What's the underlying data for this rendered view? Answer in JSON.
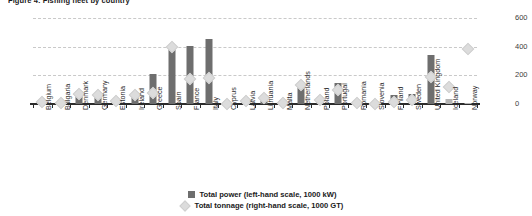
{
  "title": "Figure 4: Fishing fleet by country",
  "legend": {
    "power_label": "Total power (left-hand scale, 1000 kW)",
    "tonnage_label": "Total tonnage (right-hand scale, 1000 GT)",
    "power_color": "#6e6e6e",
    "tonnage_color": "#dcdcdc"
  },
  "axes": {
    "left_ticks": [
      "0",
      "500",
      "1000",
      "1500"
    ],
    "right_ticks": [
      "0",
      "200",
      "400",
      "600"
    ]
  },
  "chart_data": {
    "type": "bar",
    "title": "Figure 4: Fishing fleet by country",
    "xlabel": "",
    "ylabel": "Total power (1000 kW)",
    "y2label": "Total tonnage (1000 GT)",
    "ylim": [
      0,
      1500
    ],
    "y2lim": [
      0,
      600
    ],
    "grid": true,
    "legend_position": "bottom",
    "categories": [
      "Belgium",
      "Bulgaria",
      "Denmark",
      "Germany",
      "Estonia",
      "Ireland",
      "Greece",
      "Spain",
      "France",
      "Italy",
      "Cyprus",
      "Latvia",
      "Lithuania",
      "Malta",
      "Netherlands",
      "Poland",
      "Portugal",
      "Romania",
      "Slovenia",
      "Finland",
      "Sweden",
      "United Kingdom",
      "Iceland",
      "Norway"
    ],
    "series": [
      {
        "name": "Total power (left-hand scale, 1000 kW)",
        "axis": "left",
        "type": "bar",
        "values": [
          48,
          52,
          230,
          160,
          50,
          195,
          520,
          960,
          1010,
          1140,
          40,
          50,
          60,
          78,
          320,
          80,
          370,
          35,
          10,
          165,
          175,
          850,
          90,
          25
        ]
      },
      {
        "name": "Total tonnage (right-hand scale, 1000 GT)",
        "axis": "right",
        "type": "scatter",
        "values": [
          14,
          7,
          70,
          65,
          18,
          62,
          80,
          400,
          175,
          180,
          3,
          22,
          45,
          7,
          130,
          30,
          95,
          6,
          1,
          17,
          30,
          185,
          120,
          385
        ]
      }
    ]
  },
  "bars": [
    {
      "country": "Belgium",
      "power": 48,
      "tonnage": 14,
      "eu": true
    },
    {
      "country": "Bulgaria",
      "power": 52,
      "tonnage": 7,
      "eu": true
    },
    {
      "country": "Denmark",
      "power": 230,
      "tonnage": 70,
      "eu": true
    },
    {
      "country": "Germany",
      "power": 160,
      "tonnage": 65,
      "eu": true
    },
    {
      "country": "Estonia",
      "power": 50,
      "tonnage": 18,
      "eu": true
    },
    {
      "country": "Ireland",
      "power": 195,
      "tonnage": 62,
      "eu": true
    },
    {
      "country": "Greece",
      "power": 520,
      "tonnage": 80,
      "eu": true
    },
    {
      "country": "Spain",
      "power": 960,
      "tonnage": 400,
      "eu": true
    },
    {
      "country": "France",
      "power": 1010,
      "tonnage": 175,
      "eu": true
    },
    {
      "country": "Italy",
      "power": 1140,
      "tonnage": 180,
      "eu": true
    },
    {
      "country": "Cyprus",
      "power": 40,
      "tonnage": 3,
      "eu": true
    },
    {
      "country": "Latvia",
      "power": 50,
      "tonnage": 22,
      "eu": true
    },
    {
      "country": "Lithuania",
      "power": 60,
      "tonnage": 45,
      "eu": true
    },
    {
      "country": "Malta",
      "power": 78,
      "tonnage": 7,
      "eu": true
    },
    {
      "country": "Netherlands",
      "power": 320,
      "tonnage": 130,
      "eu": true
    },
    {
      "country": "Poland",
      "power": 80,
      "tonnage": 30,
      "eu": true
    },
    {
      "country": "Portugal",
      "power": 370,
      "tonnage": 95,
      "eu": true
    },
    {
      "country": "Romania",
      "power": 35,
      "tonnage": 6,
      "eu": true
    },
    {
      "country": "Slovenia",
      "power": 10,
      "tonnage": 1,
      "eu": true
    },
    {
      "country": "Finland",
      "power": 165,
      "tonnage": 17,
      "eu": true
    },
    {
      "country": "Sweden",
      "power": 175,
      "tonnage": 30,
      "eu": true
    },
    {
      "country": "United Kingdom",
      "power": 850,
      "tonnage": 185,
      "eu": true
    },
    {
      "country": "Iceland",
      "power": 90,
      "tonnage": 120,
      "eu": false
    },
    {
      "country": "Norway",
      "power": 25,
      "tonnage": 385,
      "eu": false
    }
  ]
}
